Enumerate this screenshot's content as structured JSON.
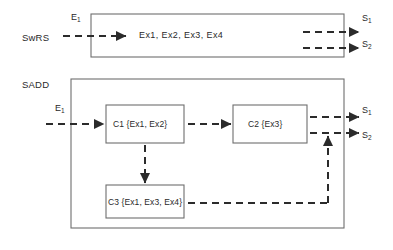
{
  "figure": {
    "type": "block-diagram",
    "tiers": [
      {
        "id": "swrs",
        "label": "SwRS",
        "label_pos": {
          "x": 22,
          "y": 33
        },
        "container": {
          "x": 91,
          "y": 14,
          "w": 253,
          "h": 43
        },
        "content_text": "Ex1,  Ex2,   Ex3, Ex4",
        "content_pos": {
          "x": 139,
          "y": 31
        },
        "inputs": [
          {
            "name": "E1",
            "text": "E",
            "sub": "1",
            "label_pos": {
              "x": 71,
              "y": 13
            }
          }
        ],
        "outputs": [
          {
            "name": "S1",
            "text": "S",
            "sub": "1",
            "label_pos": {
              "x": 362,
              "y": 14
            }
          },
          {
            "name": "S2",
            "text": "S",
            "sub": "2",
            "label_pos": {
              "x": 362,
              "y": 40
            }
          }
        ]
      },
      {
        "id": "sadd",
        "label": "SADD",
        "label_pos": {
          "x": 22,
          "y": 80
        },
        "container": {
          "x": 71,
          "y": 79,
          "w": 273,
          "h": 149
        },
        "inputs": [
          {
            "name": "E1",
            "text": "E",
            "sub": "1",
            "label_pos": {
              "x": 55,
              "y": 104
            }
          }
        ],
        "outputs": [
          {
            "name": "S1",
            "text": "S",
            "sub": "1",
            "label_pos": {
              "x": 362,
              "y": 106
            }
          },
          {
            "name": "S2",
            "text": "S",
            "sub": "2",
            "label_pos": {
              "x": 362,
              "y": 131
            }
          }
        ],
        "components": [
          {
            "id": "c1",
            "label": "C1 {Ex1, Ex2}",
            "box": {
              "x": 106,
              "y": 105,
              "w": 78,
              "h": 38
            }
          },
          {
            "id": "c2",
            "label": "C2 {Ex3}",
            "box": {
              "x": 233,
              "y": 105,
              "w": 74,
              "h": 38
            }
          },
          {
            "id": "c3",
            "label": "C3 {Ex1, Ex3, Ex4}",
            "box": {
              "x": 106,
              "y": 185,
              "w": 78,
              "h": 33
            }
          }
        ],
        "connections": [
          {
            "from": "E1",
            "to": "c1",
            "style": "dashed-arrow"
          },
          {
            "from": "c1",
            "to": "c2",
            "style": "dashed-arrow"
          },
          {
            "from": "c1",
            "to": "c3",
            "style": "dashed-arrow-down"
          },
          {
            "from": "c2",
            "to": "S1",
            "style": "dashed-arrow"
          },
          {
            "from": "c2",
            "to": "S2",
            "style": "dashed-arrow"
          },
          {
            "from": "c3",
            "to": "S2",
            "style": "dashed-arrow-up"
          }
        ]
      }
    ],
    "style": {
      "line_color": "#2b2b2b",
      "box_border_color": "#6e6e6e",
      "background": "#ffffff",
      "dash_pattern": "6,4"
    }
  }
}
